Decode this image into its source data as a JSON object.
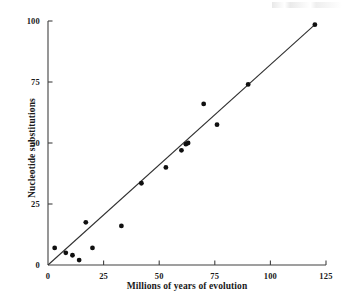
{
  "chart_data": {
    "type": "scatter",
    "title": "",
    "xlabel": "Millions of years of evolution",
    "ylabel": "Nucleotide substitutions",
    "xlim": [
      0,
      125
    ],
    "ylim": [
      0,
      100
    ],
    "xticks": [
      0,
      25,
      50,
      75,
      100,
      125
    ],
    "yticks": [
      0,
      25,
      50,
      75,
      100
    ],
    "xtick_labels": [
      "0",
      "25",
      "50",
      "75",
      "100",
      "125"
    ],
    "ytick_labels": [
      "0",
      "25",
      "50",
      "75",
      "100"
    ],
    "grid": false,
    "legend": null,
    "marker": {
      "shape": "circle",
      "color": "#101010",
      "size": 4.6
    },
    "points": [
      {
        "x": 3,
        "y": 7.0
      },
      {
        "x": 8,
        "y": 5.0
      },
      {
        "x": 11,
        "y": 4.0
      },
      {
        "x": 14,
        "y": 2.0
      },
      {
        "x": 17,
        "y": 17.5
      },
      {
        "x": 20,
        "y": 7.0
      },
      {
        "x": 33,
        "y": 16.0
      },
      {
        "x": 42,
        "y": 33.5
      },
      {
        "x": 53,
        "y": 40.0
      },
      {
        "x": 60,
        "y": 47.0
      },
      {
        "x": 62,
        "y": 49.5
      },
      {
        "x": 63,
        "y": 50.0
      },
      {
        "x": 70,
        "y": 66.0
      },
      {
        "x": 76,
        "y": 57.5
      },
      {
        "x": 90,
        "y": 74.0
      },
      {
        "x": 120,
        "y": 98.5
      }
    ],
    "fit_line": {
      "type": "linear",
      "x0": 0,
      "y0": 0,
      "x1": 120,
      "y1": 98.5,
      "color": "#303030"
    },
    "axis_color": "#404040"
  }
}
